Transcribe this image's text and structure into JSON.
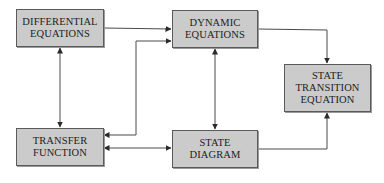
{
  "diagram": {
    "nodes": [
      {
        "id": "differential_equations",
        "lines": [
          "DIFFERENTIAL",
          "EQUATIONS"
        ]
      },
      {
        "id": "dynamic_equations",
        "lines": [
          "DYNAMIC",
          "EQUATIONS"
        ]
      },
      {
        "id": "state_transition_equation",
        "lines": [
          "STATE",
          "TRANSITION",
          "EQUATION"
        ]
      },
      {
        "id": "transfer_function",
        "lines": [
          "TRANSFER",
          "FUNCTION"
        ]
      },
      {
        "id": "state_diagram",
        "lines": [
          "STATE",
          "DIAGRAM"
        ]
      }
    ],
    "edges": [
      {
        "from": "differential_equations",
        "to": "dynamic_equations",
        "direction": "forward"
      },
      {
        "from": "differential_equations",
        "to": "transfer_function",
        "direction": "bidirectional"
      },
      {
        "from": "transfer_function",
        "to": "dynamic_equations",
        "direction": "bidirectional"
      },
      {
        "from": "transfer_function",
        "to": "state_diagram",
        "direction": "bidirectional"
      },
      {
        "from": "dynamic_equations",
        "to": "state_diagram",
        "direction": "bidirectional"
      },
      {
        "from": "dynamic_equations",
        "to": "state_transition_equation",
        "direction": "forward"
      },
      {
        "from": "state_diagram",
        "to": "state_transition_equation",
        "direction": "forward"
      }
    ],
    "colors": {
      "box_fill": "#cbcbcb",
      "box_border": "#5a5a5a",
      "line": "#3a3a3a",
      "text": "#222222"
    }
  }
}
